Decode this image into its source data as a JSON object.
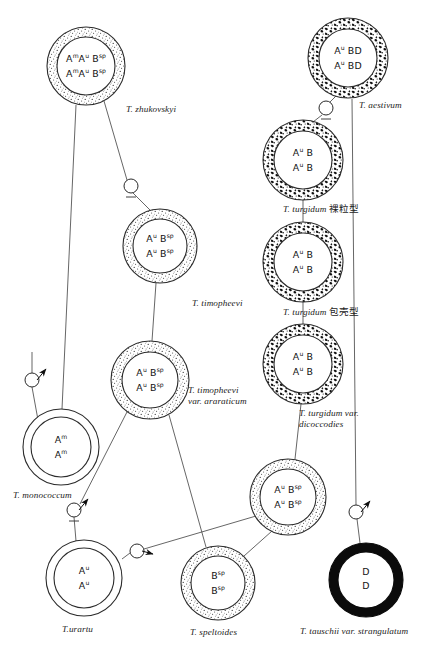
{
  "figure": {
    "caption": "",
    "background": "#ffffff",
    "ink": "#1a1a1a"
  },
  "nodes": [
    {
      "id": "zhukovskyi",
      "name": "t-zhukovskyi",
      "cx": 86,
      "cy": 66,
      "r_outer": 39,
      "r_inner": 29,
      "ring": "stipple-fine",
      "genome_lines": [
        "A<sup>m</sup>A<sup>u</sup> B<sup>sp</sup>",
        "A<sup>m</sup>A<sup>u</sup> B<sup>sp</sup>"
      ],
      "genome_plain": "AmAu Bsp / AmAu Bsp",
      "label": "T. zhukovskyi",
      "label_x": 126,
      "label_y": 104,
      "label_align": "left"
    },
    {
      "id": "aestivum",
      "name": "t-aestivum",
      "cx": 348,
      "cy": 58,
      "r_outer": 40,
      "r_inner": 29,
      "ring": "mottle-coarse",
      "genome_lines": [
        "A<sup>u</sup> BD",
        "A<sup>u</sup> BD"
      ],
      "genome_plain": "Au BD / Au BD",
      "label": "T. aestivum",
      "label_x": 359,
      "label_y": 100,
      "label_align": "left"
    },
    {
      "id": "timopheevi",
      "name": "t-timopheevi",
      "cx": 160,
      "cy": 246,
      "r_outer": 37,
      "r_inner": 27,
      "ring": "stipple-fine",
      "genome_lines": [
        "A<sup>u</sup> B<sup>sp</sup>",
        "A<sup>u</sup> B<sup>sp</sup>"
      ],
      "genome_plain": "Au Bsp / Au Bsp",
      "label": "T. timopheevi",
      "label_x": 192,
      "label_y": 298,
      "label_align": "left"
    },
    {
      "id": "turgidum-naked",
      "name": "t-turgidum-naked",
      "cx": 303,
      "cy": 160,
      "r_outer": 40,
      "r_inner": 29,
      "ring": "mottle-coarse",
      "genome_lines": [
        "A<sup>u</sup> B",
        "A<sup>u</sup> B"
      ],
      "genome_plain": "Au B / Au B",
      "label": "T. turgidum ",
      "label_cjk": "裸粒型",
      "label_x": 283,
      "label_y": 203,
      "label_align": "left"
    },
    {
      "id": "turgidum-hulled",
      "name": "t-turgidum-hulled",
      "cx": 303,
      "cy": 262,
      "r_outer": 40,
      "r_inner": 29,
      "ring": "mottle-coarse",
      "genome_lines": [
        "A<sup>u</sup> B",
        "A<sup>u</sup> B"
      ],
      "genome_plain": "Au B / Au B",
      "label": "T. turgidum ",
      "label_cjk": "包壳型",
      "label_x": 283,
      "label_y": 306,
      "label_align": "left"
    },
    {
      "id": "timopheevi-araraticum",
      "name": "t-timopheevi-var-araraticum",
      "cx": 150,
      "cy": 380,
      "r_outer": 39,
      "r_inner": 28,
      "ring": "stipple-fine",
      "genome_lines": [
        "A<sup>u</sup> B<sup>sp</sup>",
        "A<sup>u</sup> B<sup>sp</sup>"
      ],
      "genome_plain": "Au Bsp / Au Bsp",
      "label": "T. timopheevi",
      "label2": "var. araraticum",
      "label_x": 188,
      "label_y": 385,
      "label_align": "left"
    },
    {
      "id": "turgidum-dicoccodies",
      "name": "t-turgidum-var-dicoccodies",
      "cx": 303,
      "cy": 364,
      "r_outer": 40,
      "r_inner": 29,
      "ring": "mottle-coarse",
      "genome_lines": [
        "A<sup>u</sup> B",
        "A<sup>u</sup> B"
      ],
      "genome_plain": "Au B / Au B",
      "label": "T. turgidum var.",
      "label2": "dicoccodies",
      "label_x": 299,
      "label_y": 408,
      "label_align": "left"
    },
    {
      "id": "monococcum",
      "name": "t-monococcum",
      "cx": 61,
      "cy": 447,
      "r_outer": 38,
      "r_inner": 30,
      "ring": "plain",
      "genome_lines": [
        "A<sup>m</sup>",
        "A<sup>m</sup>"
      ],
      "genome_plain": "Am / Am",
      "label": "T. monococcum",
      "label_x": 13,
      "label_y": 490,
      "label_align": "left"
    },
    {
      "id": "hybrid-aubsp",
      "name": "hybrid-au-bsp",
      "cx": 288,
      "cy": 497,
      "r_outer": 38,
      "r_inner": 28,
      "ring": "stipple-fine",
      "genome_lines": [
        "A<sup>u</sup> B<sup>sp</sup>",
        "A<sup>u</sup> B<sup>sp</sup>"
      ],
      "genome_plain": "Au Bsp / Au Bsp",
      "label": "",
      "label_x": 0,
      "label_y": 0,
      "label_align": "left"
    },
    {
      "id": "urartu",
      "name": "t-urartu",
      "cx": 84,
      "cy": 578,
      "r_outer": 38,
      "r_inner": 30,
      "ring": "plain",
      "genome_lines": [
        "A<sup>u</sup>",
        "A<sup>u</sup>"
      ],
      "genome_plain": "Au / Au",
      "label": "T.urartu",
      "label_x": 62,
      "label_y": 624,
      "label_align": "left"
    },
    {
      "id": "speltoides",
      "name": "t-speltoides",
      "cx": 218,
      "cy": 583,
      "r_outer": 37,
      "r_inner": 27,
      "ring": "stipple-fine",
      "genome_lines": [
        "B<sup>sp</sup>",
        "B<sup>sp</sup>"
      ],
      "genome_plain": "Bsp / Bsp",
      "label": "T. speltoides",
      "label_x": 190,
      "label_y": 627,
      "label_align": "left"
    },
    {
      "id": "tauschii",
      "name": "t-tauschii-var-strangulatum",
      "cx": 366,
      "cy": 580,
      "r_outer": 37,
      "r_inner": 28,
      "ring": "solid-black",
      "genome_lines": [
        "D",
        "D"
      ],
      "genome_plain": "D / D",
      "label": "T. tauschii var. strangulatum",
      "label_x": 300,
      "label_y": 626,
      "label_align": "left"
    }
  ],
  "junctions": [
    {
      "id": "j1",
      "name": "cross-node-zhukovskyi-timopheevi",
      "cx": 131,
      "cy": 186,
      "r": 7,
      "tick": true,
      "arrow": null
    },
    {
      "id": "j2",
      "name": "cross-node-monococcum",
      "cx": 32,
      "cy": 380,
      "r": 7,
      "tick": false,
      "arrow": "ne"
    },
    {
      "id": "j3",
      "name": "cross-node-urartu-speltoides",
      "cx": 74,
      "cy": 510,
      "r": 7,
      "tick": true,
      "arrow": "ne"
    },
    {
      "id": "j4",
      "name": "cross-node-urartu-hybrid",
      "cx": 137,
      "cy": 551,
      "r": 7,
      "tick": false,
      "arrow": "e"
    },
    {
      "id": "j5",
      "name": "cross-node-tauschii-aestivum",
      "cx": 356,
      "cy": 512,
      "r": 7,
      "tick": false,
      "arrow": "ne"
    },
    {
      "id": "j6",
      "name": "cross-node-aestivum-turgidum",
      "cx": 326,
      "cy": 108,
      "r": 7,
      "tick": true,
      "arrow": null
    }
  ],
  "edges": [
    {
      "name": "edge-zhukovskyi-to-monococcum",
      "from": "zhukovskyi",
      "to": "monococcum"
    },
    {
      "name": "edge-zhukovskyi-to-timopheevi",
      "from": "zhukovskyi",
      "to": "timopheevi"
    },
    {
      "name": "edge-timopheevi-to-araraticum",
      "from": "timopheevi",
      "to": "timopheevi-araraticum"
    },
    {
      "name": "edge-araraticum-to-urartu",
      "from": "timopheevi-araraticum",
      "to": "urartu"
    },
    {
      "name": "edge-araraticum-to-speltoides",
      "from": "timopheevi-araraticum",
      "to": "speltoides"
    },
    {
      "name": "edge-hybrid-to-urartu",
      "from": "hybrid-aubsp",
      "to": "urartu"
    },
    {
      "name": "edge-hybrid-to-speltoides",
      "from": "hybrid-aubsp",
      "to": "speltoides"
    },
    {
      "name": "edge-hybrid-to-dicoccodies",
      "from": "hybrid-aubsp",
      "to": "turgidum-dicoccodies"
    },
    {
      "name": "edge-dicoccodies-to-hulled",
      "from": "turgidum-dicoccodies",
      "to": "turgidum-hulled"
    },
    {
      "name": "edge-hulled-to-naked",
      "from": "turgidum-hulled",
      "to": "turgidum-naked"
    },
    {
      "name": "edge-naked-to-aestivum",
      "from": "turgidum-naked",
      "to": "aestivum"
    },
    {
      "name": "edge-tauschii-to-aestivum",
      "from": "tauschii",
      "to": "aestivum"
    }
  ]
}
